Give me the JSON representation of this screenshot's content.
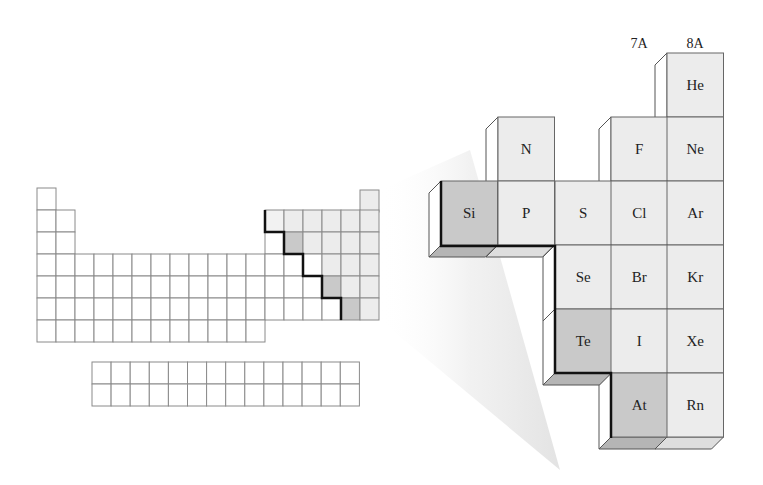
{
  "figure": {
    "group_labels": [
      "7A",
      "8A"
    ],
    "colors": {
      "metalloid": "#c9c9c9",
      "nonmetal": "#ececec",
      "metal": "#ffffff",
      "grid_line": "#8a8a8a",
      "boundary": "#111111",
      "shadow": "#e6e6e6"
    },
    "enlarged_elements": [
      {
        "symbol": "He",
        "row": 0,
        "col": 4,
        "type": "nonmetal"
      },
      {
        "symbol": "N",
        "row": 1,
        "col": 1,
        "type": "nonmetal"
      },
      {
        "symbol": "F",
        "row": 1,
        "col": 3,
        "type": "nonmetal"
      },
      {
        "symbol": "Ne",
        "row": 1,
        "col": 4,
        "type": "nonmetal"
      },
      {
        "symbol": "Si",
        "row": 2,
        "col": 0,
        "type": "metalloid"
      },
      {
        "symbol": "P",
        "row": 2,
        "col": 1,
        "type": "nonmetal"
      },
      {
        "symbol": "S",
        "row": 2,
        "col": 2,
        "type": "nonmetal"
      },
      {
        "symbol": "Cl",
        "row": 2,
        "col": 3,
        "type": "nonmetal"
      },
      {
        "symbol": "Ar",
        "row": 2,
        "col": 4,
        "type": "nonmetal"
      },
      {
        "symbol": "Se",
        "row": 3,
        "col": 2,
        "type": "nonmetal"
      },
      {
        "symbol": "Br",
        "row": 3,
        "col": 3,
        "type": "nonmetal"
      },
      {
        "symbol": "Kr",
        "row": 3,
        "col": 4,
        "type": "nonmetal"
      },
      {
        "symbol": "Te",
        "row": 4,
        "col": 2,
        "type": "metalloid"
      },
      {
        "symbol": "I",
        "row": 4,
        "col": 3,
        "type": "nonmetal"
      },
      {
        "symbol": "Xe",
        "row": 4,
        "col": 4,
        "type": "nonmetal"
      },
      {
        "symbol": "At",
        "row": 5,
        "col": 3,
        "type": "metalloid"
      },
      {
        "symbol": "Rn",
        "row": 5,
        "col": 4,
        "type": "nonmetal"
      }
    ]
  }
}
